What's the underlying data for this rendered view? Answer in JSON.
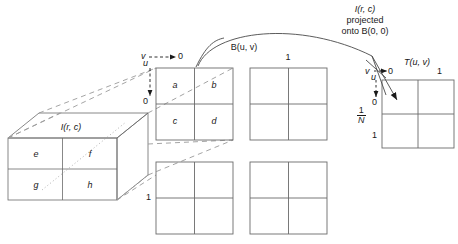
{
  "figure": {
    "background_color": "#ffffff",
    "stroke_color": "#555555",
    "text_color": "#1a1a1a",
    "width": 458,
    "height": 244
  },
  "cube": {
    "label": "I(r, c)",
    "cells": [
      {
        "name": "e",
        "text": "e"
      },
      {
        "name": "f",
        "text": "f"
      },
      {
        "name": "g",
        "text": "g"
      },
      {
        "name": "h",
        "text": "h"
      }
    ]
  },
  "block_front": {
    "label": "B(u, v)",
    "cells": [
      {
        "name": "a",
        "text": "a"
      },
      {
        "name": "b",
        "text": "b"
      },
      {
        "name": "c",
        "text": "c"
      },
      {
        "name": "d",
        "text": "d"
      }
    ],
    "axis_v_label": "v",
    "axis_v_value": "0",
    "axis_u_label": "u",
    "axis_u_value": "0"
  },
  "grid_top_right": {
    "corner_label": "1"
  },
  "grid_bottom_left": {
    "corner_label": "1"
  },
  "grid_bottom_right": {
    "corner_label": ""
  },
  "projection_caption": {
    "line1": "I(r, c)",
    "line2": "projected",
    "line3": "onto B(0, 0)"
  },
  "transform": {
    "label": "T(u, v)",
    "axis_v_label": "v",
    "axis_v_value": "0",
    "axis_v_end": "1",
    "axis_u_label": "u",
    "axis_u_value": "0",
    "axis_u_frac_num": "1",
    "axis_u_frac_den": "N",
    "axis_u_end": "1"
  }
}
